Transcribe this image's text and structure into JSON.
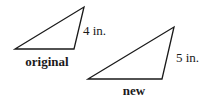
{
  "diagram": {
    "original": {
      "label": "original",
      "side_label": "4 in.",
      "vertices": [
        [
          15,
          49
        ],
        [
          84,
          7
        ],
        [
          74,
          49
        ]
      ]
    },
    "new": {
      "label": "new",
      "side_label": "5 in.",
      "vertices": [
        [
          88,
          79
        ],
        [
          174,
          27
        ],
        [
          162,
          79
        ]
      ]
    },
    "colors": {
      "stroke": "#1a1a1a",
      "background": "#ffffff"
    }
  }
}
